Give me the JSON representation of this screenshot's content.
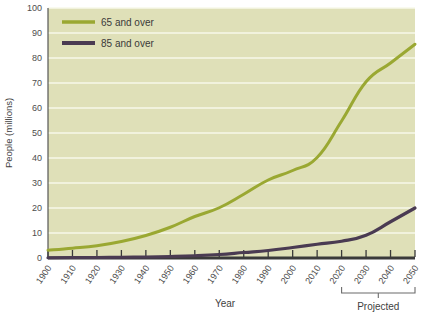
{
  "chart_data": {
    "type": "line",
    "title": "",
    "xlabel": "Year",
    "ylabel": "People (millions)",
    "xlim": [
      1900,
      2050
    ],
    "ylim": [
      0,
      100
    ],
    "grid": true,
    "legend_position": "top-left",
    "x": [
      1900,
      1910,
      1920,
      1930,
      1940,
      1950,
      1960,
      1970,
      1980,
      1990,
      2000,
      2010,
      2020,
      2030,
      2040,
      2050
    ],
    "xtick_labels": [
      "1900",
      "1910",
      "1920",
      "1930",
      "1940",
      "1950",
      "1960",
      "1970",
      "1980",
      "1990",
      "2000",
      "2010",
      "2020",
      "2030",
      "2040",
      "2050"
    ],
    "ytick_labels": [
      "0",
      "10",
      "20",
      "30",
      "40",
      "50",
      "60",
      "70",
      "80",
      "90",
      "100"
    ],
    "yticks": [
      0,
      10,
      20,
      30,
      40,
      50,
      60,
      70,
      80,
      90,
      100
    ],
    "series": [
      {
        "name": "65 and over",
        "color": "#9aa832",
        "values": [
          3.1,
          3.9,
          4.9,
          6.6,
          9.0,
          12.3,
          16.6,
          20.1,
          25.5,
          31.2,
          35.0,
          40.2,
          54.8,
          70.5,
          78.0,
          85.5
        ]
      },
      {
        "name": "85 and over",
        "color": "#4a3b52",
        "values": [
          0.1,
          0.2,
          0.2,
          0.3,
          0.4,
          0.6,
          0.9,
          1.4,
          2.2,
          3.0,
          4.2,
          5.5,
          6.7,
          9.1,
          14.5,
          20.0
        ]
      }
    ],
    "annotations": [
      {
        "name": "projected-range",
        "label": "Projected",
        "from": 2020,
        "to": 2050
      }
    ],
    "colors": {
      "plot_background": "#dfe0b8",
      "gridline": "#f7f8ea",
      "axis": "#3a3a3a",
      "series_65": "#9aa832",
      "series_85": "#4a3b52",
      "page_background": "#ffffff"
    }
  },
  "legend": {
    "items": [
      {
        "label": "65 and over",
        "color": "#9aa832"
      },
      {
        "label": "85 and over",
        "color": "#4a3b52"
      }
    ]
  },
  "axes": {
    "y_title": "People (millions)",
    "x_title": "Year"
  },
  "labels": {
    "projected": "Projected"
  }
}
